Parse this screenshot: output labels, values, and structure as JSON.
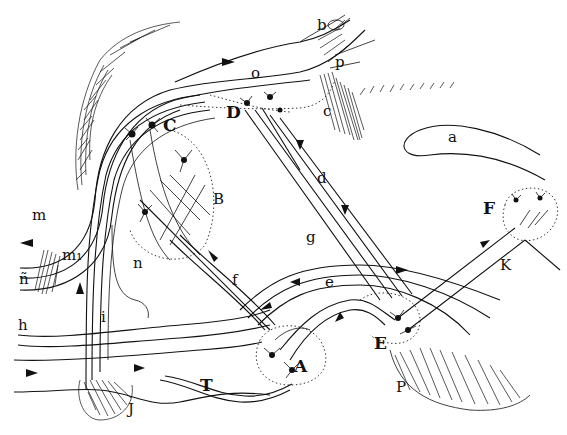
{
  "diagram": {
    "type": "neuroanatomical-circuit-drawing",
    "style": "black ink line drawing on white",
    "colors": {
      "ink": "#111111",
      "background": "#ffffff"
    },
    "labels": {
      "A": "A",
      "B": "B",
      "C": "C",
      "D": "D",
      "E": "E",
      "F": "F",
      "a": "a",
      "b": "b",
      "c": "c",
      "d": "d",
      "e": "e",
      "f": "f",
      "g": "g",
      "h": "h",
      "i": "i",
      "J": "J",
      "K": "K",
      "m": "m",
      "m1": "m₁",
      "n": "n",
      "n_tilde": "ñ",
      "o": "o",
      "p": "p",
      "P": "P",
      "T": "T"
    },
    "regions": [
      {
        "id": "A",
        "desc": "cell group at bottom center in dotted circle"
      },
      {
        "id": "B",
        "desc": "dotted region with branching cells, left-center"
      },
      {
        "id": "C",
        "desc": "pyramidal cells upper-left"
      },
      {
        "id": "D",
        "desc": "cell cluster top center"
      },
      {
        "id": "E",
        "desc": "cell group lower right"
      },
      {
        "id": "F",
        "desc": "dotted circle with cells, right"
      },
      {
        "id": "a",
        "desc": "elongated outlined shape, right"
      },
      {
        "id": "P",
        "desc": "hatched mass lower right"
      },
      {
        "id": "J",
        "desc": "hatched blob bottom left"
      },
      {
        "id": "T",
        "desc": "tract bottom center"
      }
    ]
  }
}
